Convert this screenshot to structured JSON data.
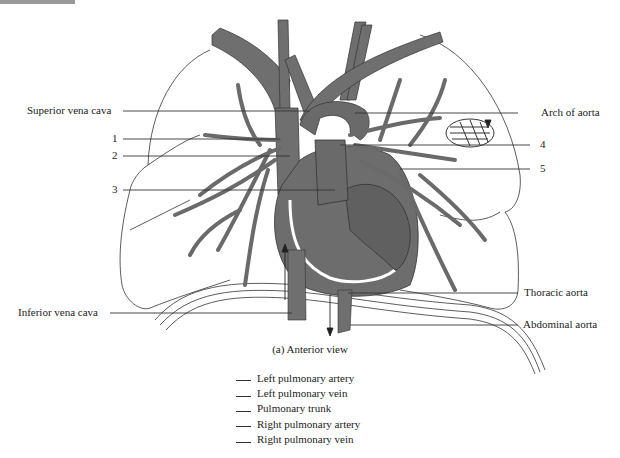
{
  "figure": {
    "caption": "(a) Anterior view",
    "colors": {
      "vessel": "#6f6f6f",
      "vessel_dark": "#5a5a5a",
      "outline": "#333333",
      "background": "#ffffff",
      "leader_line": "#333333"
    }
  },
  "labels": {
    "left": [
      {
        "id": "superior-vena-cava",
        "text": "Superior vena cava",
        "y": 111
      },
      {
        "id": "num-1",
        "text": "1",
        "y": 139
      },
      {
        "id": "num-2",
        "text": "2",
        "y": 156
      },
      {
        "id": "num-3",
        "text": "3",
        "y": 190
      },
      {
        "id": "inferior-vena-cava",
        "text": "Inferior vena cava",
        "y": 313
      }
    ],
    "right": [
      {
        "id": "arch-of-aorta",
        "text": "Arch of aorta",
        "y": 113
      },
      {
        "id": "num-4",
        "text": "4",
        "y": 145
      },
      {
        "id": "num-5",
        "text": "5",
        "y": 169
      },
      {
        "id": "thoracic-aorta",
        "text": "Thoracic aorta",
        "y": 293
      },
      {
        "id": "abdominal-aorta",
        "text": "Abdominal aorta",
        "y": 325
      }
    ]
  },
  "legend": {
    "items": [
      {
        "blank": "",
        "text": "Left pulmonary artery"
      },
      {
        "blank": "",
        "text": "Left pulmonary vein"
      },
      {
        "blank": "",
        "text": "Pulmonary trunk"
      },
      {
        "blank": "",
        "text": "Right pulmonary artery"
      },
      {
        "blank": "",
        "text": "Right pulmonary vein"
      }
    ]
  }
}
